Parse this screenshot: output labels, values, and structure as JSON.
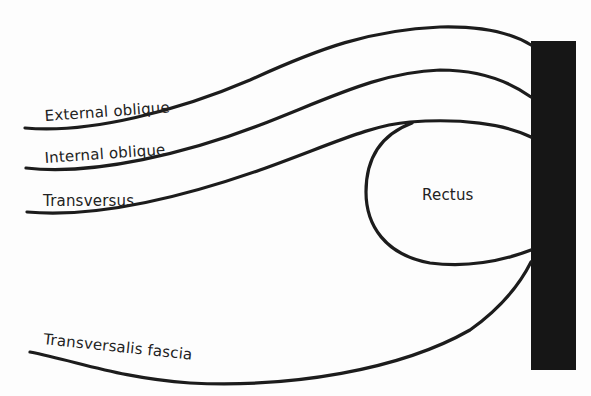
{
  "diagram": {
    "type": "anatomical cross-section",
    "labels": {
      "external_oblique": "External oblique",
      "internal_oblique": "Internal oblique",
      "transversus": "Transversus",
      "rectus": "Rectus",
      "transversalis_fascia": "Transversalis fascia"
    },
    "colors": {
      "line": "#1c1c1c",
      "linea_alba": "#161616",
      "background": "#fdfdfd",
      "text": "#222222"
    },
    "structures": [
      {
        "name": "External oblique",
        "kind": "layer-line"
      },
      {
        "name": "Internal oblique",
        "kind": "layer-line"
      },
      {
        "name": "Transversus",
        "kind": "layer-line"
      },
      {
        "name": "Rectus",
        "kind": "muscle-outline"
      },
      {
        "name": "Transversalis fascia",
        "kind": "layer-line"
      },
      {
        "name": "Midline bar",
        "kind": "vertical-block"
      }
    ]
  }
}
